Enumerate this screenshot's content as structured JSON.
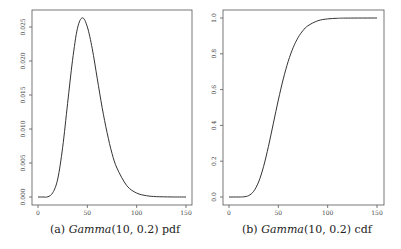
{
  "chart_data": [
    {
      "type": "line",
      "title": "",
      "caption_prefix": "(a)",
      "caption_dist": "Gamma",
      "caption_params": "(10, 0.2)",
      "caption_suffix": "pdf",
      "xlabel": "",
      "ylabel": "",
      "xlim": [
        0,
        150
      ],
      "ylim": [
        0,
        0.0265
      ],
      "x_ticks": [
        0,
        50,
        100,
        150
      ],
      "x_tick_labels": [
        "0",
        "50",
        "100",
        "150"
      ],
      "y_ticks": [
        0.0,
        0.005,
        0.01,
        0.015,
        0.02,
        0.025
      ],
      "y_tick_labels": [
        "0.000",
        "0.005",
        "0.010",
        "0.015",
        "0.020",
        "0.025"
      ],
      "grid": false,
      "series": [
        {
          "name": "Gamma(10, 0.2) pdf",
          "x": [
            0,
            5,
            10,
            15,
            20,
            25,
            30,
            35,
            40,
            45,
            50,
            55,
            60,
            65,
            70,
            75,
            80,
            90,
            100,
            110,
            120,
            135,
            150
          ],
          "values": [
            0,
            1e-07,
            3.82e-05,
            0.00064,
            0.002647,
            0.00731,
            0.01377,
            0.02011,
            0.02481,
            0.02635,
            0.02502,
            0.02179,
            0.01747,
            0.01316,
            0.00947,
            0.00642,
            0.004263,
            0.001665,
            0.000582,
            0.00019,
            5.5e-05,
            7e-06,
            1e-06
          ]
        }
      ]
    },
    {
      "type": "line",
      "title": "",
      "caption_prefix": "(b)",
      "caption_dist": "Gamma",
      "caption_params": "(10, 0.2)",
      "caption_suffix": "cdf",
      "xlabel": "",
      "ylabel": "",
      "xlim": [
        0,
        150
      ],
      "ylim": [
        0,
        1.0
      ],
      "x_ticks": [
        0,
        50,
        100,
        150
      ],
      "x_tick_labels": [
        "0",
        "50",
        "100",
        "150"
      ],
      "y_ticks": [
        0.0,
        0.2,
        0.4,
        0.6,
        0.8,
        1.0
      ],
      "y_tick_labels": [
        "0.0",
        "0.2",
        "0.4",
        "0.6",
        "0.8",
        "1.0"
      ],
      "grid": false,
      "series": [
        {
          "name": "Gamma(10, 0.2) cdf",
          "x": [
            0,
            10,
            15,
            20,
            25,
            30,
            35,
            40,
            45,
            50,
            55,
            60,
            65,
            70,
            75,
            80,
            90,
            100,
            110,
            120,
            150
          ],
          "values": [
            0,
            5e-05,
            0.0011,
            0.0081,
            0.0318,
            0.0839,
            0.1695,
            0.2834,
            0.4126,
            0.5421,
            0.6595,
            0.7576,
            0.8343,
            0.8906,
            0.9301,
            0.9567,
            0.9846,
            0.995,
            0.9985,
            0.9995,
            1.0
          ]
        }
      ]
    }
  ]
}
